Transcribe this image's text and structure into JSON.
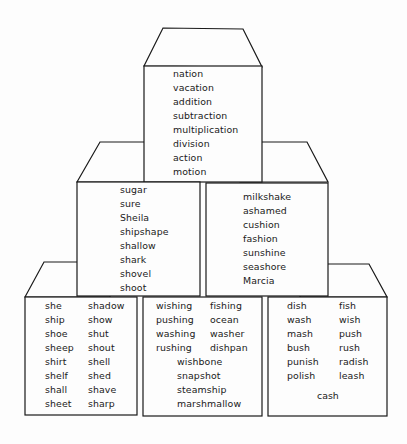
{
  "diagram": {
    "type": "stacked-word-blocks",
    "line_color": "#1a1a1a",
    "background": "#fdfdfd",
    "top_block": {
      "words": [
        "nation",
        "vacation",
        "addition",
        "subtraction",
        "multiplication",
        "division",
        "action",
        "motion"
      ]
    },
    "middle_left_block": {
      "words": [
        "sugar",
        "sure",
        "Sheila",
        "shipshape",
        "shallow",
        "shark",
        "shovel",
        "shoot"
      ]
    },
    "middle_right_block": {
      "words": [
        "milkshake",
        "ashamed",
        "cushion",
        "fashion",
        "sunshine",
        "seashore",
        "Marcia"
      ]
    },
    "bottom_left_block": {
      "column_1": [
        "she",
        "ship",
        "shoe",
        "sheep",
        "shirt",
        "shelf",
        "shall",
        "sheet"
      ],
      "column_2": [
        "shadow",
        "show",
        "shut",
        "shout",
        "shell",
        "shed",
        "shave",
        "sharp"
      ]
    },
    "bottom_middle_block": {
      "column_1": [
        "wishing",
        "pushing",
        "washing",
        "rushing"
      ],
      "column_2": [
        "fishing",
        "ocean",
        "washer",
        "dishpan"
      ],
      "centered": [
        "wishbone",
        "snapshot",
        "steamship",
        "marshmallow"
      ]
    },
    "bottom_right_block": {
      "column_1": [
        "dish",
        "wash",
        "mash",
        "bush",
        "punish",
        "polish"
      ],
      "column_2": [
        "fish",
        "wish",
        "push",
        "rush",
        "radish",
        "leash"
      ],
      "centered": [
        "cash"
      ]
    }
  }
}
